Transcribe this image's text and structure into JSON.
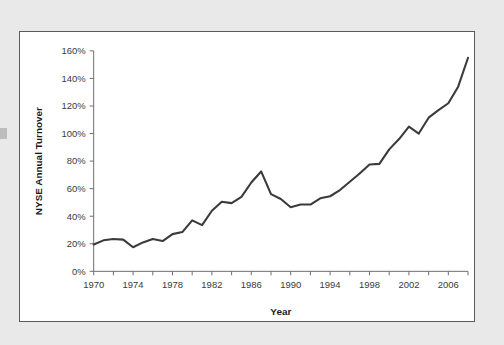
{
  "figure": {
    "panel_background": "#ffffff",
    "page_background": "#e9e9e9",
    "border_color": "#5a5a5a"
  },
  "chart_data": {
    "type": "line",
    "title": "",
    "xlabel": "Year",
    "ylabel": "NYSE Annual Turnover",
    "xlim": [
      1970,
      2008
    ],
    "ylim": [
      0,
      160
    ],
    "grid": false,
    "legend": null,
    "line_color": "#3b3b3b",
    "y_tick_labels": [
      "0%",
      "20%",
      "40%",
      "60%",
      "80%",
      "100%",
      "120%",
      "140%",
      "160%"
    ],
    "y_tick_values": [
      0,
      20,
      40,
      60,
      80,
      100,
      120,
      140,
      160
    ],
    "x_tick_labels": [
      "1970",
      "1974",
      "1978",
      "1982",
      "1986",
      "1990",
      "1994",
      "1998",
      "2002",
      "2006"
    ],
    "x_tick_values": [
      1970,
      1974,
      1978,
      1982,
      1986,
      1990,
      1994,
      1998,
      2002,
      2006
    ],
    "x_minor_tick_values": [
      1970,
      1972,
      1974,
      1976,
      1978,
      1980,
      1982,
      1984,
      1986,
      1988,
      1990,
      1992,
      1994,
      1996,
      1998,
      2000,
      2002,
      2004,
      2006,
      2008
    ],
    "x": [
      1970,
      1971,
      1972,
      1973,
      1974,
      1975,
      1976,
      1977,
      1978,
      1979,
      1980,
      1981,
      1982,
      1983,
      1984,
      1985,
      1986,
      1987,
      1988,
      1989,
      1990,
      1991,
      1992,
      1993,
      1994,
      1995,
      1996,
      1997,
      1998,
      1999,
      2000,
      2001,
      2002,
      2003,
      2004,
      2005,
      2006,
      2007,
      2008
    ],
    "values": [
      19.5,
      22.5,
      23.5,
      23.0,
      17.5,
      21.0,
      23.5,
      22.0,
      27.0,
      28.5,
      37.0,
      33.5,
      44.0,
      50.5,
      49.5,
      54.0,
      64.5,
      72.5,
      56.0,
      52.5,
      46.5,
      48.5,
      48.5,
      53.0,
      54.5,
      59.0,
      65.0,
      71.0,
      77.5,
      78.0,
      88.5,
      96.0,
      105.0,
      100.0,
      111.5,
      117.0,
      122.0,
      134.0,
      155.0
    ],
    "series_name": "NYSE Annual Turnover"
  }
}
